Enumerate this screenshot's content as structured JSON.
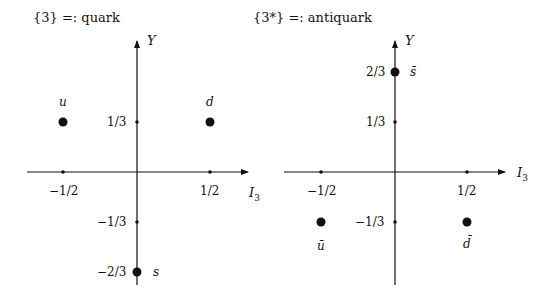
{
  "diagrams": [
    {
      "title": "{3} =: quark",
      "x_axis_label": "I",
      "x_axis_sub": "3",
      "y_axis_label": "Y",
      "x_ticks": [
        "−1/2",
        "1/2"
      ],
      "y_ticks": [
        "1/3",
        "−1/3",
        "−2/3"
      ],
      "points": [
        {
          "name": "u",
          "I3": "-1/2",
          "Y": "1/3"
        },
        {
          "name": "d",
          "I3": "1/2",
          "Y": "1/3"
        },
        {
          "name": "s",
          "I3": "0",
          "Y": "-2/3"
        }
      ]
    },
    {
      "title": "{3*} =: antiquark",
      "x_axis_label": "I",
      "x_axis_sub": "3",
      "y_axis_label": "Y",
      "x_ticks": [
        "−1/2",
        "1/2"
      ],
      "y_ticks": [
        "2/3",
        "1/3",
        "−1/3"
      ],
      "points": [
        {
          "name": "s̄",
          "I3": "0",
          "Y": "2/3"
        },
        {
          "name": "ū",
          "I3": "-1/2",
          "Y": "-1/3"
        },
        {
          "name": "d̄",
          "I3": "1/2",
          "Y": "-1/3"
        }
      ]
    }
  ],
  "colors": {
    "ink": "#111111",
    "background": "#ffffff"
  }
}
